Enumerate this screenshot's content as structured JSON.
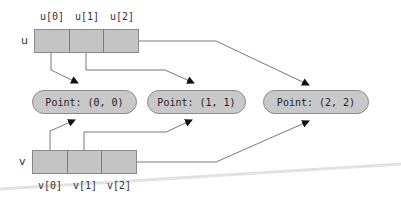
{
  "diagram": {
    "arrays": [
      {
        "name": "u",
        "cells": [
          "u[0]",
          "u[1]",
          "u[2]"
        ]
      },
      {
        "name": "v",
        "cells": [
          "v[0]",
          "v[1]",
          "v[2]"
        ]
      }
    ],
    "objects": [
      {
        "label": "Point: (0, 0)"
      },
      {
        "label": "Point: (1, 1)"
      },
      {
        "label": "Point: (2, 2)"
      }
    ],
    "references": [
      {
        "from": "u[0]",
        "to": "Point: (0, 0)"
      },
      {
        "from": "u[1]",
        "to": "Point: (1, 1)"
      },
      {
        "from": "u[2]",
        "to": "Point: (2, 2)"
      },
      {
        "from": "v[0]",
        "to": "Point: (0, 0)"
      },
      {
        "from": "v[1]",
        "to": "Point: (1, 1)"
      },
      {
        "from": "v[2]",
        "to": "Point: (2, 2)"
      }
    ],
    "colors": {
      "cell_fill": "#c4c4c4",
      "oval_fill": "#c8c8c8",
      "line": "#555555"
    }
  }
}
